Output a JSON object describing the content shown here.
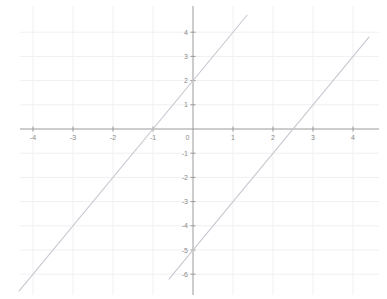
{
  "chart_data": {
    "type": "line",
    "title": "",
    "xlabel": "",
    "ylabel": "",
    "xlim": [
      -4.6,
      4.6
    ],
    "ylim": [
      -6.4,
      4.6
    ],
    "grid": true,
    "legend": "none",
    "x_ticks": [
      -4,
      -3,
      -2,
      -1,
      0,
      1,
      2,
      3,
      4
    ],
    "x_tick_labels": [
      "-4",
      "-3",
      "-2",
      "-1",
      "0",
      "1",
      "2",
      "3",
      "4"
    ],
    "y_ticks": [
      4,
      3,
      2,
      1,
      0,
      -1,
      -2,
      -3,
      -4,
      -5,
      -6
    ],
    "y_tick_labels": [
      "4",
      "3",
      "2",
      "1",
      "0",
      "-1",
      "-2",
      "-3",
      "-4",
      "-5",
      "-6"
    ],
    "series": [
      {
        "name": "line-1",
        "equation": "y = 2x + 2",
        "slope": 2,
        "y_intercept": 2,
        "x_intercept": -1,
        "color": "#c8c8d2",
        "points": [
          {
            "x": -4.35,
            "y": -6.7
          },
          {
            "x": 1.35,
            "y": 4.7
          }
        ]
      },
      {
        "name": "line-2",
        "equation": "y = 2x - 5",
        "slope": 2,
        "y_intercept": -5,
        "x_intercept": 2.5,
        "color": "#c8c8d2",
        "points": [
          {
            "x": -0.6,
            "y": -6.2
          },
          {
            "x": 4.4,
            "y": 3.8
          }
        ]
      }
    ],
    "colors": {
      "background": "#ffffff",
      "grid": "#f0f0f2",
      "axis": "#9a9a9a",
      "tick_label": "#8a8a8a",
      "line": "#c8c8d2"
    }
  }
}
